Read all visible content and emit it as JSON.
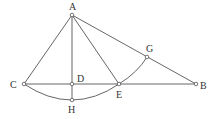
{
  "diagram": {
    "points": {
      "A": {
        "label": "A",
        "x": 72,
        "y": 15
      },
      "B": {
        "label": "B",
        "x": 196,
        "y": 84
      },
      "C": {
        "label": "C",
        "x": 24,
        "y": 84
      },
      "D": {
        "label": "D",
        "x": 72,
        "y": 84
      },
      "E": {
        "label": "E",
        "x": 119,
        "y": 84
      },
      "G": {
        "label": "G",
        "x": 147,
        "y": 57
      },
      "H": {
        "label": "H",
        "x": 72,
        "y": 100
      }
    },
    "segments": [
      "AC",
      "AB",
      "AD",
      "AE",
      "CB",
      "DH"
    ],
    "arcs": [
      "C-H-E",
      "E-G"
    ],
    "colors": {
      "stroke": "#555555",
      "text": "#333333",
      "background": "#ffffff"
    }
  }
}
